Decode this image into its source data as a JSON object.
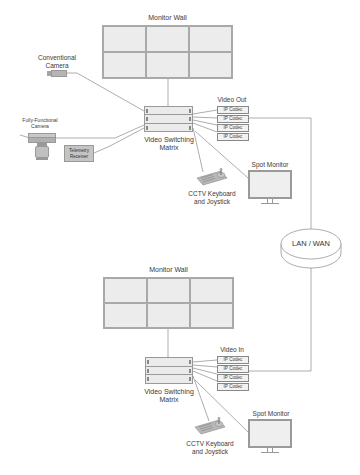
{
  "diagram": {
    "type": "CCTV network architecture",
    "top_site": {
      "monitor_wall": {
        "label": "Monitor Wall",
        "rows": 2,
        "cols": 3
      },
      "conventional_camera": {
        "label_line1": "Conventional",
        "label_line2": "Camera"
      },
      "ptz_camera": {
        "label_line1": "Fully-Functional",
        "label_line2": "Camera"
      },
      "telemetry_receiver": {
        "label_line1": "Telemetry",
        "label_line2": "Receiver"
      },
      "matrix": {
        "label_line1": "Video Switching",
        "label_line2": "Matrix"
      },
      "video_group_label": "Video Out",
      "codecs": [
        "IP Codec",
        "IP Codec",
        "IP Codec",
        "IP Codec"
      ],
      "spot_monitor": {
        "label": "Spot Monitor"
      },
      "keyboard": {
        "label_line1": "CCTV Keyboard",
        "label_line2": "and Joystick"
      }
    },
    "network": {
      "label": "LAN / WAN"
    },
    "bottom_site": {
      "monitor_wall": {
        "label": "Monitor Wall",
        "rows": 2,
        "cols": 3
      },
      "matrix": {
        "label_line1": "Video Switching",
        "label_line2": "Matrix"
      },
      "video_group_label": "Video In",
      "codecs": [
        "IP Codec",
        "IP Codec",
        "IP Codec",
        "IP Codec"
      ],
      "spot_monitor": {
        "label": "Spot Monitor"
      },
      "keyboard": {
        "label_line1": "CCTV Keyboard",
        "label_line2": "and Joystick"
      }
    },
    "colors": {
      "line": "#8a8a8a",
      "device_fill": "#e8e8e8",
      "device_border": "#999999",
      "telemetry_fill": "#c4c4c4",
      "text": "#3a3a3a"
    }
  }
}
